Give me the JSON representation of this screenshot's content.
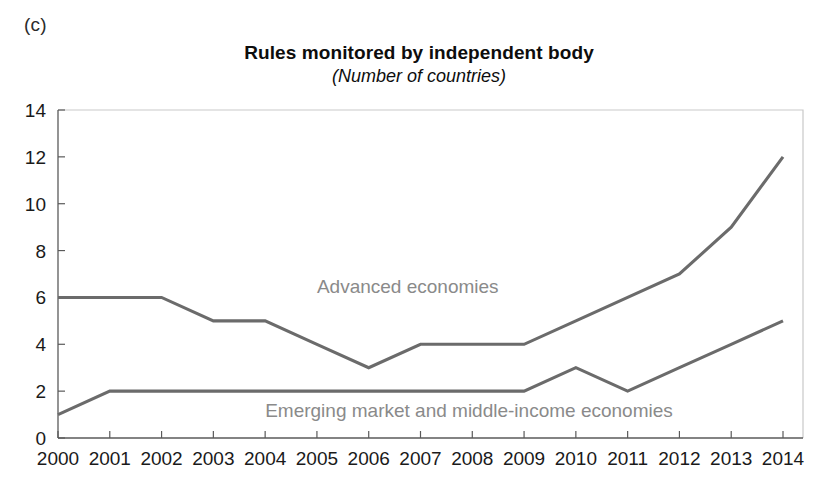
{
  "panel": {
    "label": "(c)"
  },
  "header": {
    "title": "Rules monitored by independent body",
    "subtitle": "(Number of countries)"
  },
  "chart_data": {
    "type": "line",
    "title": "Rules monitored by independent body",
    "subtitle": "(Number of countries)",
    "xlabel": "",
    "ylabel": "",
    "ylim": [
      0,
      14
    ],
    "ytick_step": 2,
    "yticks": [
      "0",
      "2",
      "4",
      "6",
      "8",
      "10",
      "12",
      "14"
    ],
    "grid": false,
    "legend_position": "inline-annotation",
    "categories": [
      "2000",
      "2001",
      "2002",
      "2003",
      "2004",
      "2005",
      "2006",
      "2007",
      "2008",
      "2009",
      "2010",
      "2011",
      "2012",
      "2013",
      "2014"
    ],
    "series": [
      {
        "name": "Advanced economies",
        "color": "#6b6b6b",
        "values": [
          6,
          6,
          6,
          5,
          5,
          4,
          3,
          4,
          4,
          4,
          5,
          6,
          7,
          9,
          12
        ]
      },
      {
        "name": "Emerging market and middle-income economies",
        "color": "#6b6b6b",
        "values": [
          1,
          2,
          2,
          2,
          2,
          2,
          2,
          2,
          2,
          2,
          3,
          2,
          3,
          4,
          5
        ]
      }
    ],
    "annotations": [
      {
        "text": "Advanced economies",
        "x_value": "2005",
        "y_value": 6.2,
        "color": "#8a8a8a"
      },
      {
        "text": "Emerging market and middle-income economies",
        "x_value": "2004",
        "y_value": 0.9,
        "color": "#8a8a8a"
      }
    ]
  },
  "colors": {
    "series_line": "#6b6b6b",
    "annotation_text": "#8a8a8a",
    "axis": "#5a5a5a",
    "frame": "#c9c9c9",
    "text": "#1a1a1a",
    "background": "#ffffff"
  }
}
